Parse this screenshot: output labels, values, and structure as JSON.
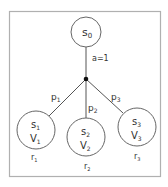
{
  "diagram": {
    "type": "probability-tree",
    "frame_color": "#b0b0b0",
    "line_color": "#555555",
    "root": {
      "state": "s",
      "state_sub": "0"
    },
    "action_label": "a=1",
    "branches": [
      {
        "prob": "p",
        "prob_sub": "1",
        "state": "s",
        "state_sub": "1",
        "value": "V",
        "value_sub": "1",
        "reward": "r",
        "reward_sub": "1"
      },
      {
        "prob": "p",
        "prob_sub": "2",
        "state": "s",
        "state_sub": "2",
        "value": "V",
        "value_sub": "2",
        "reward": "r",
        "reward_sub": "2"
      },
      {
        "prob": "p",
        "prob_sub": "3",
        "state": "s",
        "state_sub": "3",
        "value": "V",
        "value_sub": "3",
        "reward": "r",
        "reward_sub": "3"
      }
    ]
  }
}
